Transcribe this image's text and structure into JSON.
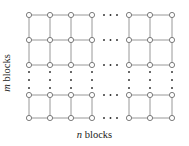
{
  "figure": {
    "name": "grid-of-blocks-diagram",
    "background_color": "#ffffff",
    "width": 189,
    "height": 146
  },
  "labels": {
    "rows": {
      "symbol": "m",
      "text": " blocks",
      "full": "m blocks",
      "rotation": -90
    },
    "columns": {
      "symbol": "n",
      "text": " blocks",
      "full": "n blocks",
      "rotation": 0
    }
  },
  "style": {
    "line_color": "#8c8c8c",
    "node_stroke": "#6e6e6e",
    "node_fill": "#ffffff",
    "dot_color": "#2b2b2b",
    "text_color": "#1a1a1a",
    "line_width": 0.9,
    "node_radius": 2.6,
    "dot_radius": 0.95
  },
  "chart_data": {
    "type": "diagram",
    "subtype": "lattice-grid-graph",
    "columns_drawn": 7,
    "rows_drawn": 5,
    "column_x": [
      29,
      50,
      71,
      92,
      129,
      150,
      172
    ],
    "row_y": [
      15,
      40,
      65,
      95,
      118
    ],
    "column_break_after_index": 3,
    "row_break_after_index": 2,
    "horizontal_ellipsis": {
      "count": 3,
      "x_positions": [
        104,
        110.5,
        117
      ],
      "row_y": [
        15,
        40,
        65,
        95,
        118
      ]
    },
    "vertical_ellipsis": {
      "count": 3,
      "y_positions": [
        72,
        80,
        88
      ],
      "column_x": [
        29,
        50,
        71,
        92,
        129,
        150,
        172
      ]
    },
    "xlabel": "n blocks",
    "ylabel": "m blocks"
  }
}
